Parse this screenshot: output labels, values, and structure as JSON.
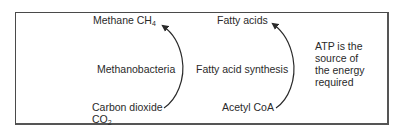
{
  "diagram": {
    "left_pathway": {
      "product": {
        "text": "Methane CH",
        "subscript": "4"
      },
      "process": "Methanobacteria",
      "substrate": {
        "line1": "Carbon dioxide",
        "line2_text": "CO",
        "line2_subscript": "2"
      }
    },
    "right_pathway": {
      "product": "Fatty acids",
      "process": "Fatty acid synthesis",
      "substrate": "Acetyl CoA"
    },
    "note": {
      "lines": [
        "ATP is the",
        "source of",
        "the energy",
        "required"
      ]
    },
    "colors": {
      "text": "#2a2a2a",
      "border": "#4a4a4a",
      "arrow": "#2a2a2a"
    }
  }
}
